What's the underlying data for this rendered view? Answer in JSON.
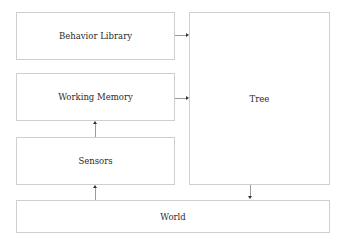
{
  "diagram": {
    "nodes": {
      "behavior_library": "Behavior Library",
      "working_memory": "Working Memory",
      "sensors": "Sensors",
      "tree": "Tree",
      "world": "World"
    },
    "edges": [
      {
        "from": "Behavior Library",
        "to": "Tree"
      },
      {
        "from": "Working Memory",
        "to": "Tree"
      },
      {
        "from": "Sensors",
        "to": "Working Memory"
      },
      {
        "from": "World",
        "to": "Sensors"
      },
      {
        "from": "Tree",
        "to": "World"
      }
    ]
  }
}
